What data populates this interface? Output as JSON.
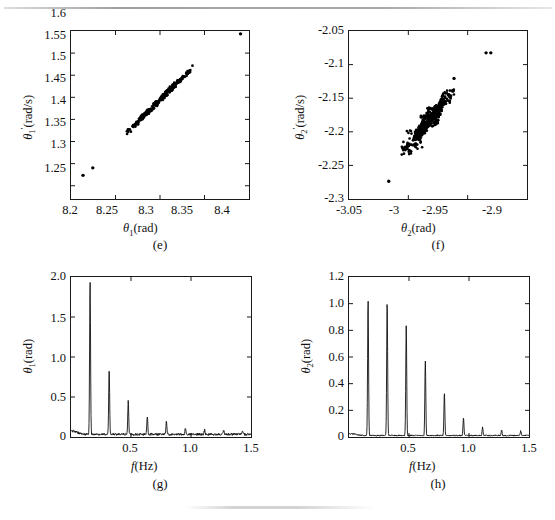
{
  "figure": {
    "background": "#ffffff",
    "ink_color": "#111111",
    "panels": [
      "e",
      "f",
      "g",
      "h"
    ]
  },
  "panel_e": {
    "caption": "(e)",
    "xlabel_theta": "θ",
    "xlabel_sub": "1",
    "xlabel_unit": "(rad)",
    "ylabel_theta": "θ",
    "ylabel_sub": "1",
    "ylabel_prime": "′",
    "ylabel_unit": "(rad/s)",
    "xticks": [
      "8.2",
      "8.25",
      "8.3",
      "8.35",
      "8.4"
    ],
    "yticks": [
      "1.25",
      "1.3",
      "1.35",
      "1.4",
      "1.45",
      "1.5",
      "1.55",
      "1.6"
    ]
  },
  "panel_f": {
    "caption": "(f)",
    "xlabel_theta": "θ",
    "xlabel_sub": "2",
    "xlabel_unit": "(rad)",
    "ylabel_theta": "θ",
    "ylabel_sub": "2",
    "ylabel_prime": "′",
    "ylabel_unit": "(rad/s)",
    "xticks": [
      "-3.05",
      "-3",
      "-2.95",
      "-2.9"
    ],
    "yticks": [
      "-2.3",
      "-2.25",
      "-2.2",
      "-2.15",
      "-2.1",
      "-2.05"
    ]
  },
  "panel_g": {
    "caption": "(g)",
    "xlabel_f": "f",
    "xlabel_unit": "(Hz)",
    "ylabel_theta": "θ",
    "ylabel_sub": "1",
    "ylabel_unit": "(rad)",
    "xticks": [
      "0.5",
      "1.0",
      "1.5"
    ],
    "yticks": [
      "0",
      "0.5",
      "1.0",
      "1.5",
      "2.0"
    ]
  },
  "panel_h": {
    "caption": "(h)",
    "xlabel_f": "f",
    "xlabel_unit": "(Hz)",
    "ylabel_theta": "θ",
    "ylabel_sub": "2",
    "ylabel_unit": "(rad)",
    "xticks": [
      "0.5",
      "1.0",
      "1.5"
    ],
    "yticks": [
      "0",
      "0.2",
      "0.4",
      "0.6",
      "0.8",
      "1.0",
      "1.2"
    ]
  },
  "chart_data": [
    {
      "id": "e",
      "type": "scatter",
      "title": "(e)",
      "xlabel": "θ₁(rad)",
      "ylabel": "θ₁′(rad/s)",
      "xlim": [
        8.2,
        8.4
      ],
      "ylim": [
        1.22,
        1.6
      ],
      "xticks": [
        8.2,
        8.25,
        8.3,
        8.35,
        8.4
      ],
      "yticks": [
        1.25,
        1.3,
        1.35,
        1.4,
        1.45,
        1.5,
        1.55,
        1.6
      ],
      "grid": false,
      "legend": null,
      "marker": "filled-circle",
      "description": "Dense near-linear attractor band plus three isolated outliers",
      "cluster": {
        "x_start": 8.2555,
        "y_start": 1.3555,
        "x_end": 8.3385,
        "y_end": 1.5215,
        "n_points": 420,
        "thickness": 0.0035,
        "gaps": [
          [
            8.258,
            8.2625
          ],
          [
            8.2665,
            8.2705
          ],
          [
            8.2885,
            8.2935
          ],
          [
            8.2975,
            8.3005
          ]
        ]
      },
      "outliers": [
        {
          "x": 8.2135,
          "y": 1.2735
        },
        {
          "x": 8.2245,
          "y": 1.2905
        },
        {
          "x": 8.3905,
          "y": 1.5935
        }
      ]
    },
    {
      "id": "f",
      "type": "scatter",
      "title": "(f)",
      "xlabel": "θ₂(rad)",
      "ylabel": "θ₂′(rad/s)",
      "xlim": [
        -3.05,
        -2.9
      ],
      "ylim": [
        -2.3,
        -2.05
      ],
      "xticks": [
        -3.05,
        -3.0,
        -2.95,
        -2.9
      ],
      "yticks": [
        -2.3,
        -2.25,
        -2.2,
        -2.15,
        -2.1,
        -2.05
      ],
      "grid": false,
      "legend": null,
      "marker": "filled-circle",
      "description": "Thicker lumpy near-linear attractor band plus three isolated outliers",
      "cluster": {
        "x_start": -3.0045,
        "y_start": -2.2335,
        "x_end": -2.9605,
        "y_end": -2.1325,
        "n_points": 520,
        "thickness": 0.0042,
        "bulges": [
          [
            -3.0,
            -2.993
          ],
          [
            -2.984,
            -2.977
          ],
          [
            -2.9695,
            -2.9635
          ]
        ]
      },
      "outliers": [
        {
          "x": -3.0165,
          "y": -2.2735
        },
        {
          "x": -2.9345,
          "y": -2.0825
        },
        {
          "x": -2.9305,
          "y": -2.0825
        },
        {
          "x": -2.9615,
          "y": -2.1205
        }
      ]
    },
    {
      "id": "g",
      "type": "line",
      "title": "(g)",
      "xlabel": "f(Hz)",
      "ylabel": "θ₁(rad)",
      "xlim": [
        0,
        1.5
      ],
      "ylim": [
        0,
        2.0
      ],
      "xticks": [
        0.5,
        1.0,
        1.5
      ],
      "yticks": [
        0,
        0.5,
        1.0,
        1.5,
        2.0
      ],
      "grid": false,
      "legend": null,
      "description": "Amplitude spectrum: harmonic comb with fundamental near 0.16 Hz, decaying harmonics",
      "noise_floor": 0.035,
      "peaks": [
        {
          "f": 0.159,
          "amp": 1.93
        },
        {
          "f": 0.318,
          "amp": 0.83
        },
        {
          "f": 0.477,
          "amp": 0.42
        },
        {
          "f": 0.636,
          "amp": 0.22
        },
        {
          "f": 0.795,
          "amp": 0.165
        },
        {
          "f": 0.954,
          "amp": 0.085
        },
        {
          "f": 1.113,
          "amp": 0.055
        },
        {
          "f": 1.272,
          "amp": 0.05
        },
        {
          "f": 1.431,
          "amp": 0.045
        }
      ]
    },
    {
      "id": "h",
      "type": "line",
      "title": "(h)",
      "xlabel": "f(Hz)",
      "ylabel": "θ₂(rad)",
      "xlim": [
        0,
        1.5
      ],
      "ylim": [
        0,
        1.2
      ],
      "xticks": [
        0.5,
        1.0,
        1.5
      ],
      "yticks": [
        0,
        0.2,
        0.4,
        0.6,
        0.8,
        1.0,
        1.2
      ],
      "grid": false,
      "legend": null,
      "description": "Amplitude spectrum: harmonic comb with slow decay, first two harmonics nearly equal",
      "noise_floor": 0.012,
      "peaks": [
        {
          "f": 0.159,
          "amp": 1.02
        },
        {
          "f": 0.318,
          "amp": 1.015
        },
        {
          "f": 0.477,
          "amp": 0.83
        },
        {
          "f": 0.636,
          "amp": 0.56
        },
        {
          "f": 0.795,
          "amp": 0.32
        },
        {
          "f": 0.954,
          "amp": 0.135
        },
        {
          "f": 1.113,
          "amp": 0.06
        },
        {
          "f": 1.272,
          "amp": 0.045
        },
        {
          "f": 1.431,
          "amp": 0.035
        }
      ]
    }
  ]
}
